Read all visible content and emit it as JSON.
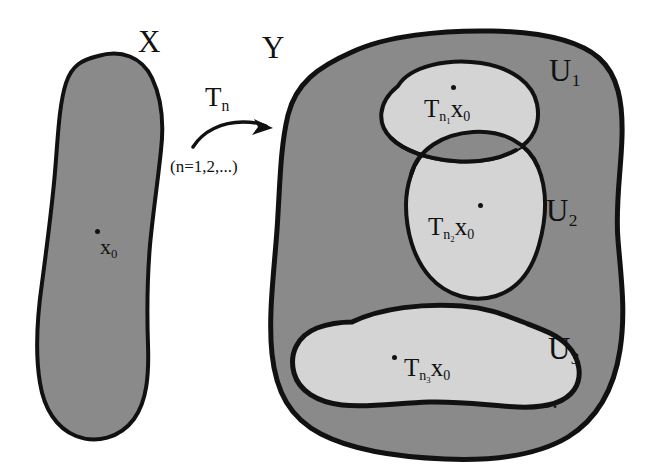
{
  "figure": {
    "caption_none": "",
    "domain_label": "X",
    "codomain_label": "Y",
    "map_label": "T",
    "map_subscript": "n",
    "map_range": "(n=1,2,...)",
    "base_point": "x",
    "base_point_subscript": "0",
    "ellipsis": "..."
  },
  "sets": {
    "X": {
      "label": "X",
      "fill": "#8a8a8a",
      "stroke": "#111111"
    },
    "Y": {
      "label": "Y",
      "fill": "#8a8a8a",
      "stroke": "#111111"
    }
  },
  "open_sets": [
    {
      "name": "U1",
      "label": "U",
      "subscript": "1",
      "fill": "#d4d4d4",
      "point_label": "T",
      "point_sub_outer": "n",
      "point_sub_inner": "1",
      "point_var": "x",
      "point_var_sub": "0",
      "point_text": "Tn1x0"
    },
    {
      "name": "U2",
      "label": "U",
      "subscript": "2",
      "fill": "#d4d4d4",
      "point_label": "T",
      "point_sub_outer": "n",
      "point_sub_inner": "2",
      "point_var": "x",
      "point_var_sub": "0",
      "point_text": "Tn2x0"
    },
    {
      "name": "U3",
      "label": "U",
      "subscript": "3",
      "fill": "#d4d4d4",
      "point_label": "T",
      "point_sub_outer": "n",
      "point_sub_inner": "3",
      "point_var": "x",
      "point_var_sub": "0",
      "point_text": "Tn3x0"
    }
  ],
  "colors": {
    "background": "#ffffff",
    "set_fill_gray": "#8a8a8a",
    "open_set_fill_gray": "#d4d4d4",
    "outline_black": "#111111"
  }
}
